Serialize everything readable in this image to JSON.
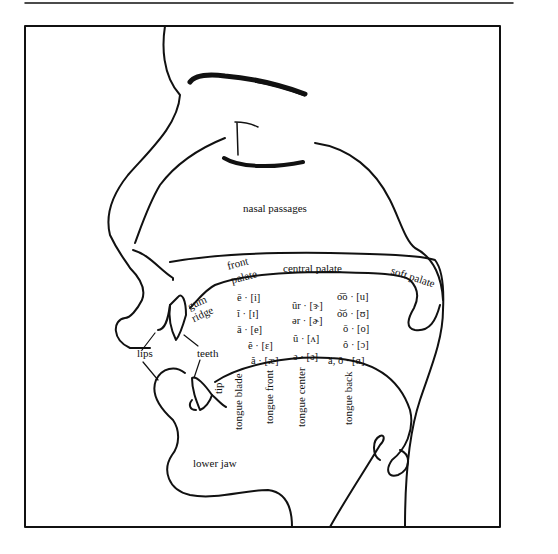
{
  "diagram": {
    "labels": {
      "nasal_passages": "nasal passages",
      "front_palate_1": "front",
      "front_palate_2": "palate",
      "central_palate": "central palate",
      "soft_palate": "soft palate",
      "gum_ridge_1": "gum",
      "gum_ridge_2": "ridge",
      "lips": "lips",
      "teeth": "teeth",
      "tip": "tip",
      "tongue_blade": "tongue blade",
      "tongue_front": "tongue front",
      "tongue_center": "tongue center",
      "tongue_back": "tongue back",
      "lower_jaw": "lower jaw"
    },
    "vowels": {
      "front": [
        "ē · [i]",
        "ĭ · [ɪ]",
        "ā · [e]",
        "ĕ · [ɛ]",
        "ă · [æ]"
      ],
      "central": [
        "ûr · [ɝ]",
        "ər · [ɚ]",
        "ŭ · [ʌ]",
        "ə · [ə]"
      ],
      "back": [
        "o͞o · [u]",
        "o͝o · [ʊ]",
        "ō · [o]",
        "ô · [ɔ]",
        "ä, ŏ · [ɑ]"
      ]
    },
    "colors": {
      "line": "#111111",
      "background": "#ffffff"
    }
  }
}
